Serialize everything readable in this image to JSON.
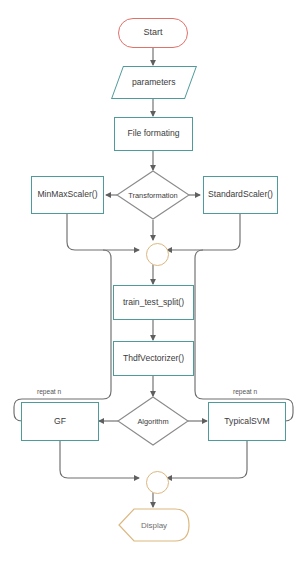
{
  "diagram": {
    "colors": {
      "process_border": "#4f9a9a",
      "start_border": "#e0726a",
      "decision_border": "#8a8a8a",
      "junction_border": "#dcb77e",
      "display_border": "#dcb77e",
      "connector": "#6e6e6e",
      "background": "#ffffff",
      "text": "#3b3b3b"
    },
    "nodes": {
      "start": {
        "label": "Start",
        "shape": "stadium"
      },
      "parameters": {
        "label": "parameters",
        "shape": "parallelogram"
      },
      "file_formating": {
        "label": "File formating",
        "shape": "rectangle"
      },
      "transformation": {
        "label": "Transformation",
        "shape": "diamond"
      },
      "minmaxscaler": {
        "label": "MinMaxScaler()",
        "shape": "rectangle"
      },
      "standardscaler": {
        "label": "StandardScaler()",
        "shape": "rectangle"
      },
      "merge_junction": {
        "label": "",
        "shape": "circle"
      },
      "train_test_split": {
        "label": "train_test_split()",
        "shape": "rectangle"
      },
      "vectorizer": {
        "label": "ThdfVectorizer()",
        "shape": "rectangle"
      },
      "algorithm": {
        "label": "Algorithm",
        "shape": "diamond"
      },
      "gf": {
        "label": "GF",
        "shape": "rectangle"
      },
      "typicalsvm": {
        "label": "TypicalSVM",
        "shape": "rectangle"
      },
      "end_junction": {
        "label": "",
        "shape": "circle"
      },
      "display": {
        "label": "Display",
        "shape": "display-terminator"
      }
    },
    "edge_labels": {
      "repeat_left": "repeat n",
      "repeat_right": "repeat n"
    }
  }
}
